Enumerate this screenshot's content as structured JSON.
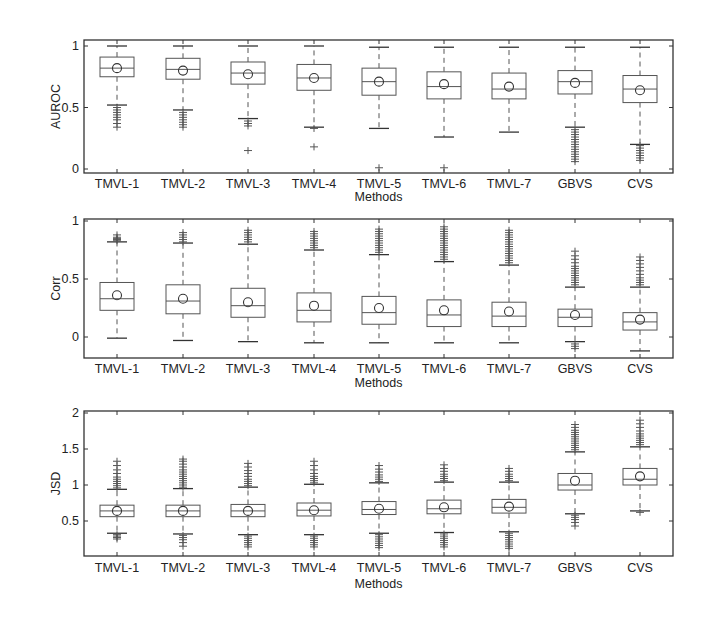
{
  "chart_data": [
    {
      "type": "box",
      "title": "",
      "xlabel": "Methods",
      "ylabel": "AUROC",
      "ylim": [
        -0.02,
        1.05
      ],
      "yticks": [
        0,
        0.5,
        1
      ],
      "ytick_labels": [
        "0",
        "0.5",
        "1"
      ],
      "grid": false,
      "categories": [
        "TMVL-1",
        "TMVL-2",
        "TMVL-3",
        "TMVL-4",
        "TMVL-5",
        "TMVL-6",
        "TMVL-7",
        "GBVS",
        "CVS"
      ],
      "series": [
        {
          "name": "TMVL-1",
          "whisker_low": 0.52,
          "q1": 0.75,
          "median": 0.82,
          "q3": 0.91,
          "whisker_high": 1.0,
          "mean": 0.82,
          "outliers": [
            0.5,
            0.48,
            0.46,
            0.44,
            0.42,
            0.4,
            0.37,
            0.34
          ]
        },
        {
          "name": "TMVL-2",
          "whisker_low": 0.48,
          "q1": 0.73,
          "median": 0.81,
          "q3": 0.9,
          "whisker_high": 1.0,
          "mean": 0.8,
          "outliers": [
            0.46,
            0.44,
            0.42,
            0.4,
            0.38,
            0.36,
            0.34
          ]
        },
        {
          "name": "TMVL-3",
          "whisker_low": 0.41,
          "q1": 0.69,
          "median": 0.78,
          "q3": 0.87,
          "whisker_high": 1.0,
          "mean": 0.77,
          "outliers": [
            0.39,
            0.37,
            0.35,
            0.15
          ]
        },
        {
          "name": "TMVL-4",
          "whisker_low": 0.34,
          "q1": 0.64,
          "median": 0.74,
          "q3": 0.85,
          "whisker_high": 1.0,
          "mean": 0.74,
          "outliers": [
            0.33,
            0.18
          ]
        },
        {
          "name": "TMVL-5",
          "whisker_low": 0.33,
          "q1": 0.6,
          "median": 0.71,
          "q3": 0.82,
          "whisker_high": 0.99,
          "mean": 0.71,
          "outliers": [
            0.01
          ]
        },
        {
          "name": "TMVL-6",
          "whisker_low": 0.26,
          "q1": 0.57,
          "median": 0.67,
          "q3": 0.79,
          "whisker_high": 0.99,
          "mean": 0.69,
          "outliers": [
            0.01
          ]
        },
        {
          "name": "TMVL-7",
          "whisker_low": 0.3,
          "q1": 0.57,
          "median": 0.65,
          "q3": 0.78,
          "whisker_high": 0.99,
          "mean": 0.67,
          "outliers": []
        },
        {
          "name": "GBVS",
          "whisker_low": 0.34,
          "q1": 0.61,
          "median": 0.71,
          "q3": 0.8,
          "whisker_high": 0.99,
          "mean": 0.7,
          "outliers": [
            0.32,
            0.3,
            0.28,
            0.26,
            0.24,
            0.22,
            0.2,
            0.18,
            0.16,
            0.14,
            0.12,
            0.1,
            0.08,
            0.06
          ]
        },
        {
          "name": "CVS",
          "whisker_low": 0.2,
          "q1": 0.54,
          "median": 0.65,
          "q3": 0.76,
          "whisker_high": 0.99,
          "mean": 0.64,
          "outliers": [
            0.19,
            0.17,
            0.15,
            0.13,
            0.11,
            0.09,
            0.07
          ]
        }
      ]
    },
    {
      "type": "box",
      "title": "",
      "xlabel": "Methods",
      "ylabel": "Corr",
      "ylim": [
        -0.18,
        1.0
      ],
      "yticks": [
        0,
        0.5,
        1
      ],
      "ytick_labels": [
        "0",
        "0.5",
        "1"
      ],
      "grid": false,
      "categories": [
        "TMVL-1",
        "TMVL-2",
        "TMVL-3",
        "TMVL-4",
        "TMVL-5",
        "TMVL-6",
        "TMVL-7",
        "GBVS",
        "CVS"
      ],
      "series": [
        {
          "name": "TMVL-1",
          "whisker_low": -0.01,
          "q1": 0.23,
          "median": 0.33,
          "q3": 0.47,
          "whisker_high": 0.82,
          "mean": 0.36,
          "outliers": [
            0.83,
            0.84,
            0.85,
            0.86,
            0.88
          ]
        },
        {
          "name": "TMVL-2",
          "whisker_low": -0.03,
          "q1": 0.2,
          "median": 0.31,
          "q3": 0.45,
          "whisker_high": 0.81,
          "mean": 0.33,
          "outliers": [
            0.82,
            0.84,
            0.86,
            0.88,
            0.9
          ]
        },
        {
          "name": "TMVL-3",
          "whisker_low": -0.04,
          "q1": 0.17,
          "median": 0.27,
          "q3": 0.42,
          "whisker_high": 0.8,
          "mean": 0.3,
          "outliers": [
            0.82,
            0.84,
            0.86,
            0.88,
            0.9,
            0.92
          ]
        },
        {
          "name": "TMVL-4",
          "whisker_low": -0.05,
          "q1": 0.13,
          "median": 0.23,
          "q3": 0.38,
          "whisker_high": 0.75,
          "mean": 0.27,
          "outliers": [
            0.77,
            0.79,
            0.81,
            0.83,
            0.85,
            0.87,
            0.89,
            0.91
          ]
        },
        {
          "name": "TMVL-5",
          "whisker_low": -0.05,
          "q1": 0.11,
          "median": 0.21,
          "q3": 0.35,
          "whisker_high": 0.71,
          "mean": 0.25,
          "outliers": [
            0.73,
            0.75,
            0.77,
            0.79,
            0.81,
            0.83,
            0.85,
            0.87,
            0.89,
            0.91,
            0.93
          ]
        },
        {
          "name": "TMVL-6",
          "whisker_low": -0.05,
          "q1": 0.09,
          "median": 0.19,
          "q3": 0.32,
          "whisker_high": 0.65,
          "mean": 0.23,
          "outliers": [
            0.67,
            0.69,
            0.71,
            0.73,
            0.75,
            0.77,
            0.79,
            0.81,
            0.83,
            0.85,
            0.87,
            0.89,
            0.91,
            0.93,
            0.95
          ]
        },
        {
          "name": "TMVL-7",
          "whisker_low": -0.05,
          "q1": 0.09,
          "median": 0.18,
          "q3": 0.3,
          "whisker_high": 0.62,
          "mean": 0.22,
          "outliers": [
            0.64,
            0.66,
            0.68,
            0.7,
            0.72,
            0.74,
            0.76,
            0.78,
            0.8,
            0.82,
            0.84,
            0.86,
            0.88,
            0.9,
            0.92
          ]
        },
        {
          "name": "GBVS",
          "whisker_low": -0.04,
          "q1": 0.09,
          "median": 0.17,
          "q3": 0.24,
          "whisker_high": 0.43,
          "mean": 0.19,
          "outliers": [
            0.45,
            0.47,
            0.49,
            0.51,
            0.53,
            0.55,
            0.57,
            0.59,
            0.61,
            0.64,
            0.67,
            0.7,
            0.74,
            -0.06,
            -0.08,
            -0.1
          ]
        },
        {
          "name": "CVS",
          "whisker_low": -0.12,
          "q1": 0.06,
          "median": 0.13,
          "q3": 0.21,
          "whisker_high": 0.43,
          "mean": 0.15,
          "outliers": [
            0.45,
            0.47,
            0.49,
            0.51,
            0.54,
            0.57,
            0.6,
            0.63,
            0.66,
            0.69
          ]
        }
      ]
    },
    {
      "type": "box",
      "title": "",
      "xlabel": "Methods",
      "ylabel": "JSD",
      "ylim": [
        0,
        2.0
      ],
      "yticks": [
        0.5,
        1,
        1.5,
        2
      ],
      "ytick_labels": [
        "0.5",
        "1",
        "1.5",
        "2"
      ],
      "grid": false,
      "categories": [
        "TMVL-1",
        "TMVL-2",
        "TMVL-3",
        "TMVL-4",
        "TMVL-5",
        "TMVL-6",
        "TMVL-7",
        "GBVS",
        "CVS"
      ],
      "series": [
        {
          "name": "TMVL-1",
          "whisker_low": 0.33,
          "q1": 0.56,
          "median": 0.64,
          "q3": 0.72,
          "whisker_high": 0.94,
          "mean": 0.64,
          "outliers": [
            0.96,
            0.99,
            1.02,
            1.05,
            1.08,
            1.11,
            1.16,
            1.21,
            1.27,
            1.33,
            0.31,
            0.29,
            0.27,
            0.25
          ]
        },
        {
          "name": "TMVL-2",
          "whisker_low": 0.32,
          "q1": 0.56,
          "median": 0.64,
          "q3": 0.72,
          "whisker_high": 0.95,
          "mean": 0.64,
          "outliers": [
            0.97,
            1.0,
            1.03,
            1.06,
            1.09,
            1.12,
            1.15,
            1.18,
            1.21,
            1.25,
            1.29,
            1.33,
            1.36,
            0.3,
            0.27,
            0.24,
            0.2,
            0.15
          ]
        },
        {
          "name": "TMVL-3",
          "whisker_low": 0.31,
          "q1": 0.56,
          "median": 0.64,
          "q3": 0.73,
          "whisker_high": 0.97,
          "mean": 0.64,
          "outliers": [
            0.99,
            1.02,
            1.05,
            1.08,
            1.12,
            1.16,
            1.2,
            1.25,
            1.3,
            0.29,
            0.26,
            0.23,
            0.2,
            0.17,
            0.14
          ]
        },
        {
          "name": "TMVL-4",
          "whisker_low": 0.31,
          "q1": 0.57,
          "median": 0.65,
          "q3": 0.75,
          "whisker_high": 1.01,
          "mean": 0.65,
          "outliers": [
            1.03,
            1.06,
            1.09,
            1.12,
            1.16,
            1.21,
            1.27,
            1.33,
            0.29,
            0.26,
            0.23,
            0.2,
            0.17,
            0.14
          ]
        },
        {
          "name": "TMVL-5",
          "whisker_low": 0.33,
          "q1": 0.59,
          "median": 0.66,
          "q3": 0.77,
          "whisker_high": 1.03,
          "mean": 0.67,
          "outliers": [
            1.05,
            1.08,
            1.11,
            1.14,
            1.18,
            1.22,
            1.27,
            0.31,
            0.28,
            0.25,
            0.22,
            0.19,
            0.16,
            0.13
          ]
        },
        {
          "name": "TMVL-6",
          "whisker_low": 0.34,
          "q1": 0.6,
          "median": 0.67,
          "q3": 0.79,
          "whisker_high": 1.04,
          "mean": 0.69,
          "outliers": [
            1.06,
            1.09,
            1.12,
            1.15,
            1.19,
            1.23,
            1.28,
            0.32,
            0.29,
            0.26,
            0.23,
            0.2,
            0.17,
            0.14
          ]
        },
        {
          "name": "TMVL-7",
          "whisker_low": 0.35,
          "q1": 0.61,
          "median": 0.69,
          "q3": 0.8,
          "whisker_high": 1.04,
          "mean": 0.7,
          "outliers": [
            1.06,
            1.09,
            1.12,
            1.15,
            1.19,
            1.23,
            0.33,
            0.3,
            0.27,
            0.24,
            0.21,
            0.18,
            0.15,
            0.12
          ]
        },
        {
          "name": "GBVS",
          "whisker_low": 0.6,
          "q1": 0.93,
          "median": 1.0,
          "q3": 1.16,
          "whisker_high": 1.46,
          "mean": 1.06,
          "outliers": [
            1.49,
            1.52,
            1.55,
            1.58,
            1.61,
            1.64,
            1.67,
            1.7,
            1.73,
            1.76,
            1.8,
            1.84,
            0.58,
            0.55,
            0.52,
            0.48,
            0.43
          ]
        },
        {
          "name": "CVS",
          "whisker_low": 0.64,
          "q1": 1.0,
          "median": 1.08,
          "q3": 1.23,
          "whisker_high": 1.53,
          "mean": 1.12,
          "outliers": [
            1.56,
            1.59,
            1.62,
            1.65,
            1.68,
            1.71,
            1.75,
            1.8,
            1.85,
            1.9,
            0.62
          ]
        }
      ]
    }
  ],
  "panels": [
    {
      "ylabel": "AUROC",
      "xlabel": "Methods"
    },
    {
      "ylabel": "Corr",
      "xlabel": "Methods"
    },
    {
      "ylabel": "JSD",
      "xlabel": "Methods"
    }
  ],
  "style": {
    "axis_color": "#333333",
    "box_color": "#555555",
    "outlier_color": "#555555",
    "background": "#ffffff"
  }
}
